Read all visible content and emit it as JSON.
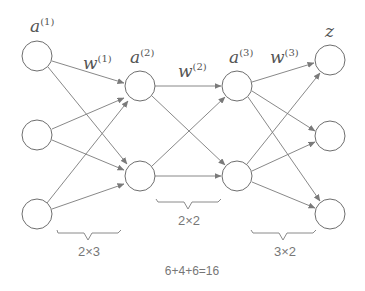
{
  "diagram": {
    "layers": [
      {
        "label": "a",
        "superscript": "(1)",
        "nodes": 3
      },
      {
        "label": "a",
        "superscript": "(2)",
        "nodes": 2
      },
      {
        "label": "a",
        "superscript": "(3)",
        "nodes": 2
      },
      {
        "label": "z",
        "superscript": "",
        "nodes": 3
      }
    ],
    "weights": [
      {
        "label": "w",
        "superscript": "(1)"
      },
      {
        "label": "w",
        "superscript": "(2)"
      },
      {
        "label": "w",
        "superscript": "(3)"
      }
    ],
    "dimensions": [
      "2×3",
      "2×2",
      "3×2"
    ],
    "total": "6+4+6=16"
  },
  "colors": {
    "stroke": "#6e6e6e",
    "text": "#555555",
    "background": "#ffffff"
  }
}
